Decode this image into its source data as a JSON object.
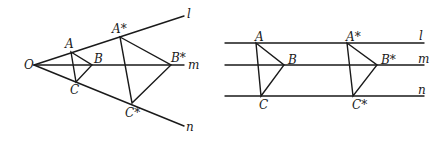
{
  "figures": [
    {
      "name": "central-projection",
      "center_label": "O",
      "line_labels": [
        "l",
        "m",
        "n"
      ],
      "triangle": {
        "vertices": [
          "A",
          "B",
          "C"
        ]
      },
      "image_triangle": {
        "vertices": [
          "A*",
          "B*",
          "C*"
        ]
      }
    },
    {
      "name": "parallel-projection",
      "line_labels": [
        "l",
        "m",
        "n"
      ],
      "triangle": {
        "vertices": [
          "A",
          "B",
          "C"
        ]
      },
      "image_triangle": {
        "vertices": [
          "A*",
          "B*",
          "C*"
        ]
      }
    }
  ],
  "colors": {
    "ink": "#1a1a1a",
    "background": "#ffffff"
  }
}
